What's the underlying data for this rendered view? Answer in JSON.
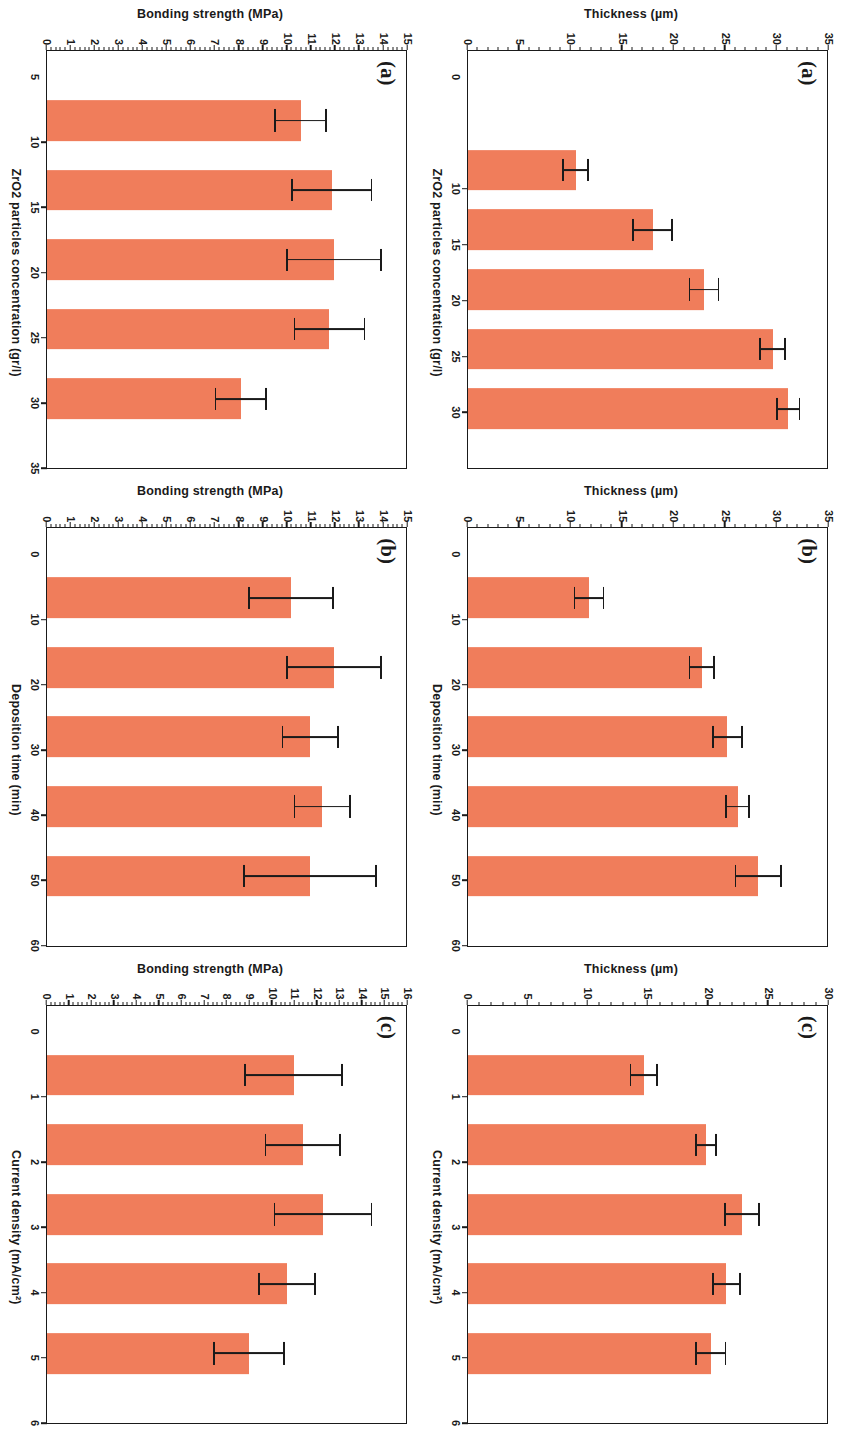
{
  "figure": {
    "bar_color": "#f07d5b",
    "axis_color": "#1a1a1a",
    "background": "#ffffff"
  },
  "chart_data": [
    {
      "id": "a-thickness",
      "type": "bar",
      "panel": "(a)",
      "title": "",
      "xlabel": "ZrO2 particles concentration (gr/l)",
      "ylabel": "Thickness (µm)",
      "categories": [
        "10",
        "15",
        "20",
        "25",
        "30"
      ],
      "values": [
        10.5,
        18.0,
        23.0,
        29.7,
        31.2
      ],
      "errors": [
        1.3,
        2.0,
        1.5,
        1.3,
        1.2
      ],
      "xlim": [
        0,
        35
      ],
      "ylim": [
        0,
        35
      ],
      "yticks": [
        0,
        5,
        10,
        15,
        20,
        25,
        30,
        35
      ],
      "xticks": [
        "10",
        "15",
        "20",
        "25",
        "30"
      ],
      "grid": false,
      "legend": "none"
    },
    {
      "id": "b-thickness",
      "type": "bar",
      "panel": "(b)",
      "title": "",
      "xlabel": "Deposition time (min)",
      "ylabel": "Thickness (µm)",
      "categories": [
        "10",
        "20",
        "30",
        "40",
        "50"
      ],
      "values": [
        11.8,
        22.8,
        25.3,
        26.3,
        28.3
      ],
      "errors": [
        1.5,
        1.3,
        1.5,
        1.2,
        2.3
      ],
      "xlim": [
        0,
        60
      ],
      "ylim": [
        0,
        35
      ],
      "yticks": [
        0,
        5,
        10,
        15,
        20,
        25,
        30,
        35
      ],
      "xticks": [
        "10",
        "20",
        "30",
        "40",
        "50",
        "60"
      ],
      "grid": false,
      "legend": "none"
    },
    {
      "id": "c-thickness",
      "type": "bar",
      "panel": "(c)",
      "title": "",
      "xlabel": "Current density (mA/cm²)",
      "ylabel": "Thickness (µm)",
      "categories": [
        "1",
        "2",
        "3",
        "4",
        "5"
      ],
      "values": [
        14.7,
        19.9,
        22.9,
        21.6,
        20.3
      ],
      "errors": [
        1.2,
        0.9,
        1.5,
        1.2,
        1.3
      ],
      "xlim": [
        0,
        6
      ],
      "ylim": [
        0,
        30
      ],
      "yticks": [
        0,
        5,
        10,
        15,
        20,
        25,
        30
      ],
      "xticks": [
        "1",
        "2",
        "3",
        "4",
        "5",
        "6"
      ],
      "grid": false,
      "legend": "none"
    },
    {
      "id": "a-bonding",
      "type": "bar",
      "panel": "(a)",
      "title": "",
      "xlabel": "ZrO2 particles concentration (gr/l)",
      "ylabel": "Bonding strength (MPa)",
      "categories": [
        "10",
        "15",
        "20",
        "25",
        "30"
      ],
      "values": [
        10.6,
        11.9,
        12.0,
        11.8,
        8.1
      ],
      "errors": [
        1.1,
        1.7,
        2.0,
        1.5,
        1.1
      ],
      "xlim": [
        5,
        35
      ],
      "ylim": [
        0,
        15
      ],
      "yticks": [
        0,
        1,
        2,
        3,
        4,
        5,
        6,
        7,
        8,
        9,
        10,
        11,
        12,
        13,
        14,
        15
      ],
      "xticks": [
        "10",
        "15",
        "20",
        "25",
        "30",
        "35"
      ],
      "grid": false,
      "legend": "none"
    },
    {
      "id": "b-bonding",
      "type": "bar",
      "panel": "(b)",
      "title": "",
      "xlabel": "Deposition time (min)",
      "ylabel": "Bonding strength (MPa)",
      "categories": [
        "10",
        "20",
        "30",
        "40",
        "50"
      ],
      "values": [
        10.2,
        12.0,
        11.0,
        11.5,
        11.0
      ],
      "errors": [
        1.8,
        2.0,
        1.2,
        1.2,
        2.8
      ],
      "xlim": [
        0,
        60
      ],
      "ylim": [
        0,
        15
      ],
      "yticks": [
        0,
        1,
        2,
        3,
        4,
        5,
        6,
        7,
        8,
        9,
        10,
        11,
        12,
        13,
        14,
        15
      ],
      "xticks": [
        "10",
        "20",
        "30",
        "40",
        "50",
        "60"
      ],
      "grid": false,
      "legend": "none"
    },
    {
      "id": "c-bonding",
      "type": "bar",
      "panel": "(c)",
      "title": "",
      "xlabel": "Current density (mA/cm²)",
      "ylabel": "Bonding strength (MPa)",
      "categories": [
        "1",
        "2",
        "3",
        "4",
        "5"
      ],
      "values": [
        11.0,
        11.4,
        12.3,
        10.7,
        9.0
      ],
      "errors": [
        2.2,
        1.7,
        2.2,
        1.3,
        1.6
      ],
      "xlim": [
        0,
        6
      ],
      "ylim": [
        0,
        16
      ],
      "yticks": [
        0,
        1,
        2,
        3,
        4,
        5,
        6,
        7,
        8,
        9,
        10,
        11,
        12,
        13,
        14,
        15,
        16
      ],
      "xticks": [
        "1",
        "2",
        "3",
        "4",
        "5",
        "6"
      ],
      "grid": false,
      "legend": "none"
    }
  ]
}
